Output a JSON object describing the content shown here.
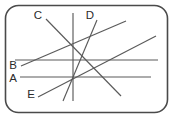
{
  "figure": {
    "canvas": {
      "width": 173,
      "height": 118
    },
    "frame": {
      "name": "rounded-rectangle-border",
      "x": 5.5,
      "y": 5.5,
      "width": 162,
      "height": 107,
      "radius": 13,
      "stroke_color": "#4a4a4a",
      "fill_color": "#ffffff"
    },
    "line_color": "#5a5a5a",
    "label_color": "#2b2b2b",
    "lines": [
      {
        "id": "A",
        "name": "line-a-horizontal-lower",
        "kind": "horizontal",
        "x1": 20,
        "y1": 77,
        "x2": 151,
        "y2": 77
      },
      {
        "id": "B",
        "name": "line-b-horizontal-upper",
        "kind": "horizontal",
        "x1": 15,
        "y1": 60,
        "x2": 158,
        "y2": 60
      },
      {
        "id": "C",
        "name": "line-c-descending-diagonal",
        "kind": "diagonal-descending",
        "x1": 46,
        "y1": 19,
        "x2": 121,
        "y2": 96
      },
      {
        "id": "D",
        "name": "line-d-steep-descending-diagonal",
        "kind": "diagonal-steep-descending",
        "x1": 97,
        "y1": 20,
        "x2": 63,
        "y2": 101
      },
      {
        "id": "E",
        "name": "line-e-ascending-diagonal",
        "kind": "diagonal-ascending",
        "x1": 38,
        "y1": 97,
        "x2": 156,
        "y2": 36
      },
      {
        "id": "F",
        "name": "line-f-ascending-diagonal-upper",
        "kind": "diagonal-ascending",
        "x1": 21,
        "y1": 66,
        "x2": 126,
        "y2": 21
      },
      {
        "id": "V",
        "name": "line-v-vertical",
        "kind": "vertical",
        "x1": 73,
        "y1": 13,
        "x2": 73,
        "y2": 101
      }
    ],
    "labels": [
      {
        "id": "C",
        "name": "label-c",
        "text": "C",
        "x": 38,
        "y": 16
      },
      {
        "id": "D",
        "name": "label-d",
        "text": "D",
        "x": 90,
        "y": 16
      },
      {
        "id": "B",
        "name": "label-b",
        "text": "B",
        "x": 13,
        "y": 66
      },
      {
        "id": "A",
        "name": "label-a",
        "text": "A",
        "x": 13,
        "y": 79
      },
      {
        "id": "E",
        "name": "label-e",
        "text": "E",
        "x": 31,
        "y": 95
      }
    ]
  }
}
